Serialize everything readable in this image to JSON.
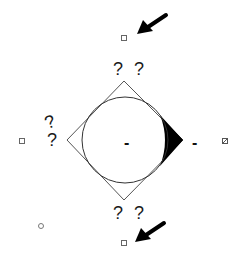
{
  "diagram": {
    "shapes": {
      "diamond": {
        "top": [
          124,
          81
        ],
        "right": [
          183,
          140
        ],
        "bottom": [
          124,
          200
        ],
        "left": [
          67,
          140
        ],
        "stroke": "#555555"
      },
      "circle": {
        "cx": 125,
        "cy": 140,
        "r": 43,
        "stroke": "#333333"
      },
      "lens": {
        "fill": "#000000"
      }
    },
    "labels": {
      "top": "? ?",
      "bottom": "? ?",
      "left_upper": "?",
      "left_lower": "?",
      "center_dash": "-",
      "right_dash": "-"
    },
    "markers": {
      "top_square": [
        124,
        38
      ],
      "left_square": [
        22,
        141
      ],
      "bottom_square": [
        124,
        243
      ],
      "right_icon": [
        225,
        141
      ],
      "bottom_left_circle": [
        41,
        226
      ]
    },
    "arrows": {
      "top": {
        "color": "#000000"
      },
      "bottom": {
        "color": "#000000"
      }
    }
  }
}
